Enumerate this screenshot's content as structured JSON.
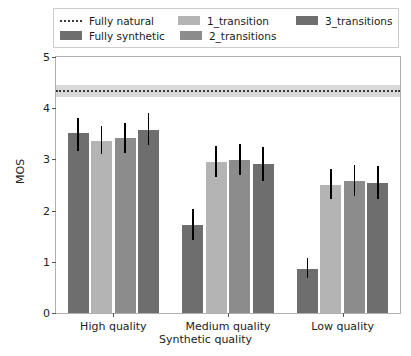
{
  "chart_data": {
    "type": "bar",
    "title": "",
    "xlabel": "Synthetic quality",
    "ylabel": "MOS",
    "ylim": [
      0,
      5
    ],
    "yticks": [
      0,
      1,
      2,
      3,
      4,
      5
    ],
    "grid": false,
    "legend_position": "upper center",
    "categories": [
      "High quality",
      "Medium quality",
      "Low quality"
    ],
    "series": [
      {
        "name": "Fully synthetic",
        "color": "#6e6e6e",
        "values": [
          3.52,
          1.72,
          0.86
        ],
        "err_low": [
          3.17,
          1.43,
          0.68
        ],
        "err_high": [
          3.8,
          2.03,
          1.07
        ]
      },
      {
        "name": "1_transition",
        "color": "#b4b4b4",
        "values": [
          3.36,
          2.95,
          2.5
        ],
        "err_low": [
          3.1,
          2.65,
          2.22
        ],
        "err_high": [
          3.66,
          3.27,
          2.82
        ]
      },
      {
        "name": "2_transitions",
        "color": "#8c8c8c",
        "values": [
          3.42,
          2.99,
          2.58
        ],
        "err_low": [
          3.13,
          2.7,
          2.29
        ],
        "err_high": [
          3.72,
          3.3,
          2.9
        ]
      },
      {
        "name": "3_transitions",
        "color": "#6e6e6e",
        "values": [
          3.58,
          2.91,
          2.54
        ],
        "err_low": [
          3.28,
          2.58,
          2.22
        ],
        "err_high": [
          3.9,
          3.25,
          2.88
        ]
      }
    ],
    "reference_line": {
      "name": "Fully natural",
      "value": 4.35,
      "band_low": 4.22,
      "band_high": 4.46,
      "style": "dotted",
      "color": "#3a3a3a",
      "band_color": "#d9d9d9"
    }
  },
  "legend": {
    "entries": [
      {
        "label": "Fully natural",
        "marker": "dotted-line",
        "color": "#3a3a3a"
      },
      {
        "label": "Fully synthetic",
        "marker": "swatch",
        "color": "#6e6e6e"
      },
      {
        "label": "1_transition",
        "marker": "swatch",
        "color": "#b4b4b4"
      },
      {
        "label": "2_transitions",
        "marker": "swatch",
        "color": "#8c8c8c"
      },
      {
        "label": "3_transitions",
        "marker": "swatch",
        "color": "#6e6e6e"
      }
    ]
  },
  "axes": {
    "ytick_labels": [
      "0",
      "1",
      "2",
      "3",
      "4",
      "5"
    ],
    "xtick_labels": [
      "High quality",
      "Medium quality",
      "Low quality"
    ],
    "ylabel": "MOS",
    "xlabel": "Synthetic quality"
  }
}
